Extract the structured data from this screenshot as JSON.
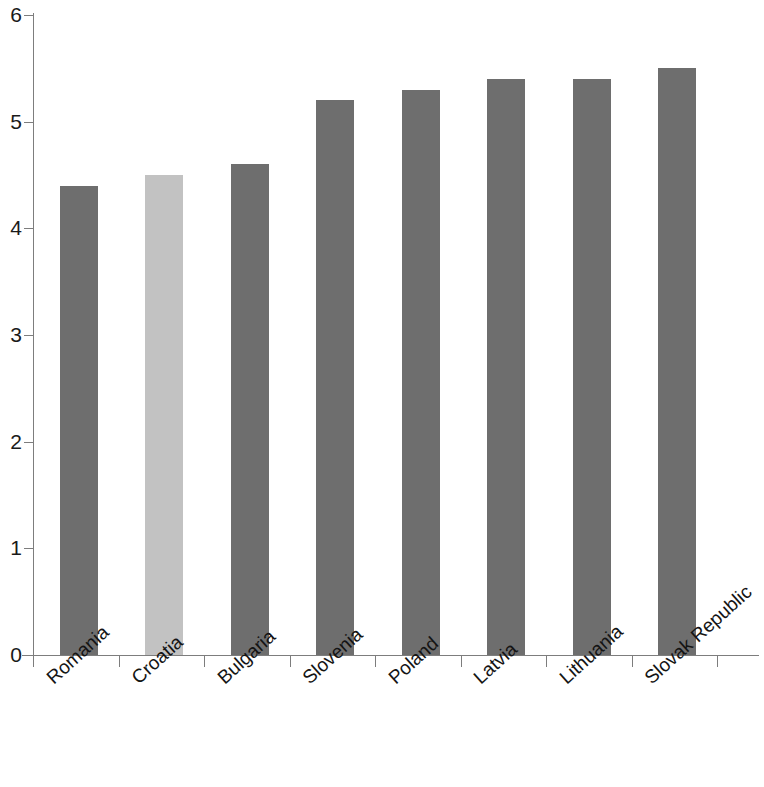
{
  "chart_data": {
    "type": "bar",
    "title": "",
    "subtitle": "",
    "xlabel": "",
    "ylabel": "",
    "ylim": [
      0,
      6
    ],
    "yticks": [
      0,
      1,
      2,
      3,
      4,
      5,
      6
    ],
    "ytick_labels": [
      "0",
      "1",
      "2",
      "3",
      "4",
      "5",
      "6"
    ],
    "grid": false,
    "legend": null,
    "categories": [
      "Romania",
      "Croatia",
      "Bulgaria",
      "Slovenia",
      "Poland",
      "Latvia",
      "Lithuania",
      "Slovak Republic"
    ],
    "values": [
      4.4,
      4.5,
      4.6,
      5.2,
      5.3,
      5.4,
      5.4,
      5.5
    ],
    "bar_colors": [
      "#6e6e6e",
      "#c2c2c2",
      "#6e6e6e",
      "#6e6e6e",
      "#6e6e6e",
      "#6e6e6e",
      "#6e6e6e",
      "#6e6e6e"
    ],
    "highlight_category": "Croatia",
    "colors": {
      "bar_default": "#6e6e6e",
      "bar_highlight": "#c2c2c2",
      "axis": "#7d7d7d",
      "text": "#1a1a1a",
      "background": "#ffffff"
    }
  }
}
